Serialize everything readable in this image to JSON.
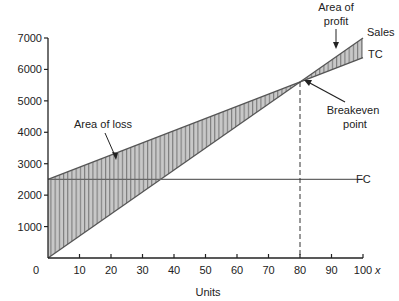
{
  "chart_data": {
    "type": "line",
    "title": "",
    "xlabel": "Units",
    "x_axis_symbol": "x",
    "ylabel": "",
    "xlim": [
      0,
      100
    ],
    "ylim": [
      0,
      7000
    ],
    "x_ticks": [
      0,
      10,
      20,
      30,
      40,
      50,
      60,
      70,
      80,
      90,
      100
    ],
    "y_ticks": [
      1000,
      2000,
      3000,
      4000,
      5000,
      6000,
      7000
    ],
    "grid": false,
    "x": [
      0,
      80,
      100
    ],
    "series": [
      {
        "name": "Sales",
        "values": [
          0,
          5600,
          7000
        ]
      },
      {
        "name": "TC",
        "values": [
          2500,
          5600,
          6375
        ]
      },
      {
        "name": "FC",
        "values": [
          2500,
          2500,
          2500
        ]
      }
    ],
    "annotations": [
      {
        "text": "Area of loss",
        "x": 20,
        "y": 3200
      },
      {
        "text": "Area of profit",
        "x": 90,
        "y": 6400
      },
      {
        "text": "Breakeven point",
        "x": 80,
        "y": 5600
      }
    ],
    "breakeven": {
      "units": 80,
      "value": 5600
    }
  },
  "labels": {
    "sales": "Sales",
    "tc": "TC",
    "fc": "FC",
    "area_loss": "Area of loss",
    "area_profit_1": "Area of",
    "area_profit_2": "profit",
    "breakeven_1": "Breakeven",
    "breakeven_2": "point",
    "xlabel": "Units",
    "x_symbol": "x",
    "origin": "0"
  }
}
